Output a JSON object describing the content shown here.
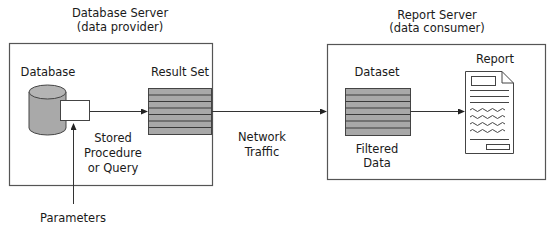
{
  "diagram": {
    "database_server": {
      "title": "Database Server",
      "subtitle": "(data provider)",
      "database_label": "Database",
      "result_set_label": "Result Set",
      "stored_procedure_lines": [
        "Stored",
        "Procedure",
        "or Query"
      ]
    },
    "network": {
      "lines": [
        "Network",
        "Traffic"
      ]
    },
    "report_server": {
      "title": "Report Server",
      "subtitle": "(data consumer)",
      "dataset_label": "Dataset",
      "report_label": "Report",
      "filtered_data_lines": [
        "Filtered",
        "Data"
      ]
    },
    "parameters_label": "Parameters",
    "colors": {
      "grid_fill": "#a8a8a8",
      "cylinder_fill": "#a9a9a9",
      "stroke": "#444444",
      "background": "#ffffff"
    }
  }
}
